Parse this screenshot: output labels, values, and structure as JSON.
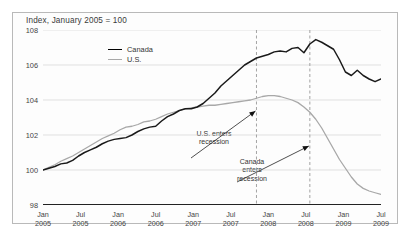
{
  "figure": {
    "title": "Index, January 2005 = 100",
    "background": "#ffffff",
    "frame_color": "#b9b9b9"
  },
  "legend": {
    "position": "top-center",
    "items": [
      {
        "label": "Canada",
        "color": "#1a1a1a"
      },
      {
        "label": "U.S.",
        "color": "#a8a8a8"
      }
    ]
  },
  "annotations": [
    {
      "name": "us-recession",
      "line1": "U.S. enters",
      "line2": "recession",
      "at_x": "Jan 2008"
    },
    {
      "name": "canada-recession",
      "line1": "Canada",
      "line2": "enters",
      "line3": "recession",
      "at_x": "Oct 2008"
    }
  ],
  "chart_data": {
    "type": "line",
    "title": "Index, January 2005 = 100",
    "xlabel": "",
    "ylabel": "",
    "ylim": [
      98,
      108
    ],
    "yticks": [
      98,
      100,
      102,
      104,
      106,
      108
    ],
    "grid": true,
    "xticks": [
      {
        "month": "Jan",
        "year": "2005"
      },
      {
        "month": "Jul",
        "year": "2005"
      },
      {
        "month": "Jan",
        "year": "2006"
      },
      {
        "month": "Jul",
        "year": "2006"
      },
      {
        "month": "Jan",
        "year": "2007"
      },
      {
        "month": "Jul",
        "year": "2007"
      },
      {
        "month": "Jan",
        "year": "2008"
      },
      {
        "month": "Jul",
        "year": "2008"
      },
      {
        "month": "Jan",
        "year": "2009"
      },
      {
        "month": "Jul",
        "year": "2009"
      }
    ],
    "x": [
      "2005-01",
      "2005-02",
      "2005-03",
      "2005-04",
      "2005-05",
      "2005-06",
      "2005-07",
      "2005-08",
      "2005-09",
      "2005-10",
      "2005-11",
      "2005-12",
      "2006-01",
      "2006-02",
      "2006-03",
      "2006-04",
      "2006-05",
      "2006-06",
      "2006-07",
      "2006-08",
      "2006-09",
      "2006-10",
      "2006-11",
      "2006-12",
      "2007-01",
      "2007-02",
      "2007-03",
      "2007-04",
      "2007-05",
      "2007-06",
      "2007-07",
      "2007-08",
      "2007-09",
      "2007-10",
      "2007-11",
      "2007-12",
      "2008-01",
      "2008-02",
      "2008-03",
      "2008-04",
      "2008-05",
      "2008-06",
      "2008-07",
      "2008-08",
      "2008-09",
      "2008-10",
      "2008-11",
      "2008-12",
      "2009-01",
      "2009-02",
      "2009-03",
      "2009-04",
      "2009-05",
      "2009-06",
      "2009-07",
      "2009-08",
      "2009-09",
      "2009-10"
    ],
    "series": [
      {
        "name": "Canada",
        "color": "#1a1a1a",
        "width": 1.5,
        "values": [
          100.0,
          100.1,
          100.2,
          100.35,
          100.4,
          100.55,
          100.8,
          101.0,
          101.15,
          101.3,
          101.5,
          101.65,
          101.75,
          101.8,
          101.85,
          102.0,
          102.2,
          102.35,
          102.45,
          102.5,
          102.8,
          103.05,
          103.2,
          103.4,
          103.5,
          103.5,
          103.6,
          103.8,
          104.1,
          104.4,
          104.8,
          105.1,
          105.4,
          105.7,
          106.0,
          106.2,
          106.4,
          106.5,
          106.6,
          106.75,
          106.8,
          106.75,
          106.95,
          107.0,
          106.7,
          107.2,
          107.45,
          107.3,
          107.1,
          106.9,
          106.3,
          105.6,
          105.4,
          105.7,
          105.4,
          105.2,
          105.05,
          105.2
        ]
      },
      {
        "name": "U.S.",
        "color": "#a8a8a8",
        "width": 1.3,
        "values": [
          100.0,
          100.15,
          100.3,
          100.5,
          100.65,
          100.8,
          101.0,
          101.2,
          101.4,
          101.6,
          101.8,
          101.95,
          102.1,
          102.3,
          102.45,
          102.5,
          102.6,
          102.75,
          102.8,
          102.9,
          103.05,
          103.2,
          103.3,
          103.4,
          103.5,
          103.55,
          103.6,
          103.65,
          103.7,
          103.7,
          103.75,
          103.8,
          103.85,
          103.9,
          103.95,
          104.0,
          104.1,
          104.2,
          104.25,
          104.25,
          104.2,
          104.1,
          104.0,
          103.85,
          103.6,
          103.3,
          102.9,
          102.4,
          101.8,
          101.2,
          100.6,
          100.1,
          99.6,
          99.2,
          98.95,
          98.8,
          98.7,
          98.6
        ]
      }
    ],
    "vlines": [
      {
        "name": "us-recession-start",
        "x": "2008-01",
        "style": "dashed",
        "color": "#9a9a9a"
      },
      {
        "name": "canada-recession-start",
        "x": "2008-10",
        "style": "dashed",
        "color": "#9a9a9a"
      }
    ]
  }
}
